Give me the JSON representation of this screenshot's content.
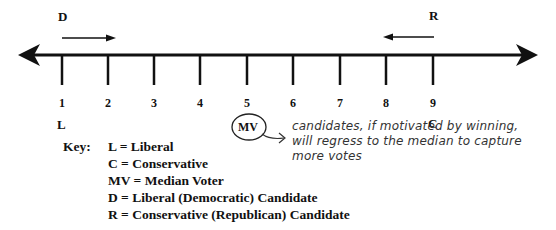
{
  "diagram": {
    "type": "median-voter-number-line",
    "axis": {
      "ticks": [
        "1",
        "2",
        "3",
        "4",
        "5",
        "6",
        "7",
        "8",
        "9"
      ],
      "bidirectional": true
    },
    "labels": {
      "left_end": "L",
      "right_end": "C",
      "candidate_left": "D",
      "candidate_right": "R",
      "median": "MV"
    },
    "annotation": {
      "line1": "candidates, if motivated by winning,",
      "line2": "will regress to the median to capture",
      "line3": "more votes"
    },
    "key": {
      "title": "Key:",
      "items": [
        "L = Liberal",
        "C = Conservative",
        "MV = Median Voter",
        "D = Liberal (Democratic) Candidate",
        "R = Conservative (Republican) Candidate"
      ]
    },
    "colors": {
      "ink": "#111111",
      "handwriting": "#333333",
      "background": "#ffffff"
    }
  }
}
